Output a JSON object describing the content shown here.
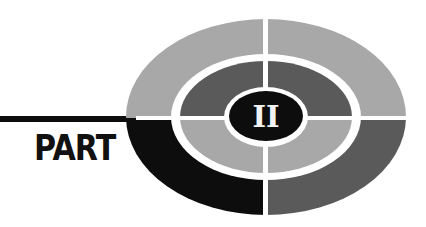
{
  "emblem": {
    "label": "PART",
    "numeral": "II"
  },
  "colors": {
    "background": "#ffffff",
    "black": "#0d0d0d",
    "light_gray": "#a8a8a8",
    "dark_gray": "#5a5a5a",
    "separator": "#ffffff",
    "numeral_fill": "#f2f2f2"
  }
}
